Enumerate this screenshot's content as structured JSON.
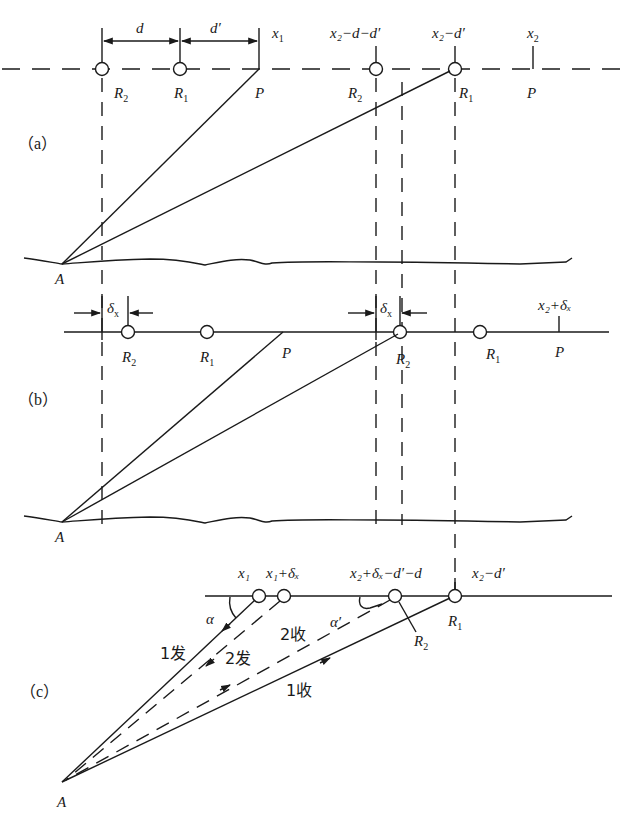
{
  "figure": {
    "panels": {
      "a": {
        "label": "（a）",
        "dimension_labels": {
          "d": "d",
          "d_prime": "d′"
        },
        "top_labels": {
          "x1": "x",
          "x1_sub": "1",
          "x2_minus_d_minus_dp": "x₂−d−d′",
          "x2_minus_dp": "x₂−d′",
          "x2": "x",
          "x2_sub": "2"
        },
        "points": [
          {
            "name": "R",
            "sub": "2"
          },
          {
            "name": "R",
            "sub": "1"
          },
          {
            "name": "P",
            "sub": ""
          },
          {
            "name": "R",
            "sub": "2"
          },
          {
            "name": "R",
            "sub": "1"
          },
          {
            "name": "P",
            "sub": ""
          }
        ],
        "origin": "A"
      },
      "b": {
        "label": "（b）",
        "delta_label": "δ",
        "delta_sub": "x",
        "top_label": "x₂+δₓ",
        "points": [
          {
            "name": "R",
            "sub": "2"
          },
          {
            "name": "R",
            "sub": "1"
          },
          {
            "name": "P",
            "sub": ""
          },
          {
            "name": "R",
            "sub": "2"
          },
          {
            "name": "R",
            "sub": "1"
          },
          {
            "name": "P",
            "sub": ""
          }
        ],
        "origin": "A"
      },
      "c": {
        "label": "（c）",
        "top_labels": {
          "x1": "x₁",
          "x1_plus_dx": "x₁+δₓ",
          "x2_dx_dp_d": "x₂+δₓ−d′−d",
          "x2_minus_dp": "x₂−d′"
        },
        "angles": {
          "alpha": "α",
          "alpha_prime": "α′"
        },
        "rays": {
          "send1": "1发",
          "send2": "2发",
          "recv1": "1收",
          "recv2": "2收"
        },
        "points": {
          "R1": "R",
          "R1_sub": "1",
          "R2": "R",
          "R2_sub": "2"
        },
        "origin": "A"
      }
    }
  }
}
